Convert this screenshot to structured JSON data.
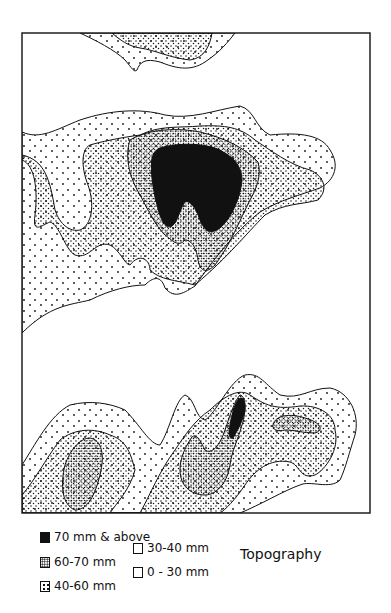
{
  "map": {
    "title": "Topography",
    "frame": {
      "x": 22,
      "y": 33,
      "width": 348,
      "height": 480
    },
    "colors": {
      "line": "#111111",
      "background": "#ffffff"
    }
  },
  "legend": {
    "items": [
      {
        "label": "70 mm & above",
        "pattern": "solid-black"
      },
      {
        "label": "60-70 mm",
        "pattern": "dense-stipple"
      },
      {
        "label": "40-60 mm",
        "pattern": "medium-stipple"
      },
      {
        "label": "30-40 mm",
        "pattern": "sparse-dots"
      },
      {
        "label": "0 - 30 mm",
        "pattern": "blank"
      }
    ]
  }
}
